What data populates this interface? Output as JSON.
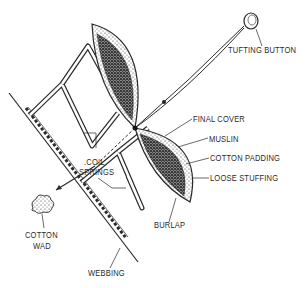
{
  "diagram": {
    "type": "upholstery-cross-section",
    "colors": {
      "ink": "#2a2a2a",
      "background": "#ffffff"
    },
    "labels": {
      "tufting_button": "TUFTING BUTTON",
      "final_cover": "FINAL COVER",
      "muslin": "MUSLIN",
      "cotton_padding": "COTTON PADDING",
      "loose_stuffing": "LOOSE STUFFING",
      "coil_springs_line1": ".COIL",
      "coil_springs_line2": "SPRINGS",
      "burlap": "BURLAP",
      "cotton_wad_line1": "COTTON",
      "cotton_wad_line2": "WAD",
      "webbing": "WEBBING"
    }
  }
}
